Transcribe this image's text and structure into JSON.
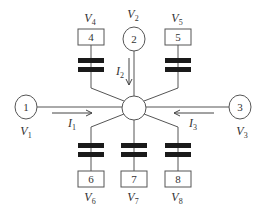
{
  "diagram": {
    "hub": {
      "label": ""
    },
    "nodes": [
      {
        "id": "1",
        "shape": "circle",
        "voltage": "V",
        "voltage_sub": "1"
      },
      {
        "id": "2",
        "shape": "circle",
        "voltage": "V",
        "voltage_sub": "2"
      },
      {
        "id": "3",
        "shape": "circle",
        "voltage": "V",
        "voltage_sub": "3"
      },
      {
        "id": "4",
        "shape": "box",
        "voltage": "V",
        "voltage_sub": "4"
      },
      {
        "id": "5",
        "shape": "box",
        "voltage": "V",
        "voltage_sub": "5"
      },
      {
        "id": "6",
        "shape": "box",
        "voltage": "V",
        "voltage_sub": "6"
      },
      {
        "id": "7",
        "shape": "box",
        "voltage": "V",
        "voltage_sub": "7"
      },
      {
        "id": "8",
        "shape": "box",
        "voltage": "V",
        "voltage_sub": "8"
      }
    ],
    "currents": [
      {
        "name": "I",
        "sub": "1",
        "direction": "node 1 to hub"
      },
      {
        "name": "I",
        "sub": "2",
        "direction": "node 2 to hub"
      },
      {
        "name": "I",
        "sub": "3",
        "direction": "node 3 to hub"
      }
    ],
    "colors": {
      "line": "#555555",
      "plate": "#1a1a1a",
      "text": "#333333",
      "background": "#ffffff"
    }
  }
}
